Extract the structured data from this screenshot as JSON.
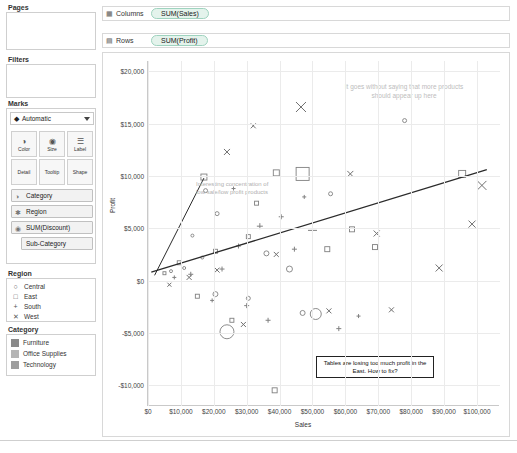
{
  "shelves": {
    "pages_title": "Pages",
    "filters_title": "Filters",
    "marks_title": "Marks",
    "columns_label": "Columns",
    "rows_label": "Rows",
    "columns_pill": "SUM(Sales)",
    "rows_pill": "SUM(Profit)",
    "columns_icon": "columns-grid-icon",
    "rows_icon": "rows-grid-icon"
  },
  "marks": {
    "type_value": "Automatic",
    "type_icon": "mark-type-icon",
    "buttons": [
      {
        "label": "Color",
        "icon": "color-palette-icon"
      },
      {
        "label": "Size",
        "icon": "size-circle-icon"
      },
      {
        "label": "Label",
        "icon": "label-text-icon"
      },
      {
        "label": "Detail",
        "icon": "detail-icon"
      },
      {
        "label": "Tooltip",
        "icon": "tooltip-icon"
      },
      {
        "label": "Shape",
        "icon": "shape-icon"
      }
    ],
    "pills": [
      {
        "label": "Category",
        "icon": "color-palette-icon",
        "indent": false
      },
      {
        "label": "Region",
        "icon": "shape-icon",
        "indent": false
      },
      {
        "label": "SUM(Discount)",
        "icon": "size-circle-icon",
        "indent": false
      },
      {
        "label": "Sub-Category",
        "icon": "",
        "indent": true
      }
    ]
  },
  "legends": {
    "region": {
      "title": "Region",
      "items": [
        {
          "label": "Central",
          "glyph": "○"
        },
        {
          "label": "East",
          "glyph": "□"
        },
        {
          "label": "South",
          "glyph": "+"
        },
        {
          "label": "West",
          "glyph": "✕"
        }
      ]
    },
    "category": {
      "title": "Category",
      "items": [
        {
          "label": "Furniture",
          "color": "#8a8a8a"
        },
        {
          "label": "Office Supplies",
          "color": "#b5b5b5"
        },
        {
          "label": "Technology",
          "color": "#9e9e9e"
        }
      ]
    }
  },
  "annotations": {
    "top": "It goes without saying that more products should appear up here",
    "left": "Interesting concentration of low sale/low profit products",
    "callout": "Tables are losing too much profit in the East. How to fix?"
  },
  "chart_data": {
    "type": "scatter",
    "title": "",
    "xlabel": "Sales",
    "ylabel": "Profit",
    "xlim": [
      0,
      107000
    ],
    "ylim": [
      -12000,
      21000
    ],
    "xticks": [
      "$0",
      "$10,000",
      "$20,000",
      "$30,000",
      "$40,000",
      "$50,000",
      "$60,000",
      "$70,000",
      "$80,000",
      "$90,000",
      "$100,000"
    ],
    "xtick_values": [
      0,
      10000,
      20000,
      30000,
      40000,
      50000,
      60000,
      70000,
      80000,
      90000,
      100000
    ],
    "yticks": [
      "$20,000",
      "$15,000",
      "$10,000",
      "$5,000",
      "$0",
      "-$5,000",
      "-$10,000"
    ],
    "ytick_values": [
      20000,
      15000,
      10000,
      5000,
      0,
      -5000,
      -10000
    ],
    "grid": true,
    "legend_position": "left-panel",
    "trendline": {
      "x0": 1000,
      "y0": 800,
      "x1": 103000,
      "y1": 10600
    },
    "inner_trendline": {
      "x0": 2000,
      "y0": 500,
      "x1": 17000,
      "y1": 9800
    },
    "series": [
      {
        "name": "Central",
        "shape": "circle",
        "points": [
          {
            "x": 24000,
            "y": -4900,
            "size": 14
          },
          {
            "x": 51000,
            "y": -3200,
            "size": 11
          },
          {
            "x": 43000,
            "y": 1100,
            "size": 6
          },
          {
            "x": 20500,
            "y": -1300,
            "size": 5
          },
          {
            "x": 36000,
            "y": 2600,
            "size": 5
          },
          {
            "x": 47000,
            "y": -3100,
            "size": 5
          },
          {
            "x": 30500,
            "y": -1700,
            "size": 4
          },
          {
            "x": 78000,
            "y": 15300,
            "size": 4
          },
          {
            "x": 55500,
            "y": 8300,
            "size": 4
          },
          {
            "x": 17500,
            "y": 8600,
            "size": 4
          },
          {
            "x": 21000,
            "y": 6400,
            "size": 4
          },
          {
            "x": 13500,
            "y": 4300,
            "size": 3
          },
          {
            "x": 11000,
            "y": 1200,
            "size": 3
          },
          {
            "x": 7000,
            "y": 900,
            "size": 3
          },
          {
            "x": 16500,
            "y": 2200,
            "size": 3
          }
        ]
      },
      {
        "name": "East",
        "shape": "square",
        "points": [
          {
            "x": 47000,
            "y": 10200,
            "size": 13
          },
          {
            "x": 95500,
            "y": 10200,
            "size": 7
          },
          {
            "x": 39000,
            "y": 10300,
            "size": 6
          },
          {
            "x": 17000,
            "y": 9900,
            "size": 6
          },
          {
            "x": 62000,
            "y": 4900,
            "size": 5
          },
          {
            "x": 69000,
            "y": 3200,
            "size": 5
          },
          {
            "x": 54500,
            "y": 3000,
            "size": 5
          },
          {
            "x": 30500,
            "y": 4200,
            "size": 4
          },
          {
            "x": 20500,
            "y": 2800,
            "size": 4
          },
          {
            "x": 9500,
            "y": 1700,
            "size": 4
          },
          {
            "x": 38500,
            "y": -10500,
            "size": 5
          },
          {
            "x": 25500,
            "y": -3800,
            "size": 4
          },
          {
            "x": 15000,
            "y": -1500,
            "size": 4
          },
          {
            "x": 5000,
            "y": 700,
            "size": 3
          },
          {
            "x": 33000,
            "y": 7400,
            "size": 4
          }
        ]
      },
      {
        "name": "South",
        "shape": "plus",
        "points": [
          {
            "x": 50000,
            "y": 4800,
            "size": 9
          },
          {
            "x": 34000,
            "y": 5200,
            "size": 6
          },
          {
            "x": 40500,
            "y": 6100,
            "size": 5
          },
          {
            "x": 44500,
            "y": 3000,
            "size": 5
          },
          {
            "x": 27500,
            "y": 3300,
            "size": 5
          },
          {
            "x": 22500,
            "y": 1100,
            "size": 5
          },
          {
            "x": 13000,
            "y": 600,
            "size": 5
          },
          {
            "x": 8000,
            "y": 300,
            "size": 4
          },
          {
            "x": 30000,
            "y": -2400,
            "size": 5
          },
          {
            "x": 36500,
            "y": -3800,
            "size": 5
          },
          {
            "x": 58000,
            "y": -4600,
            "size": 5
          },
          {
            "x": 64000,
            "y": -3400,
            "size": 4
          },
          {
            "x": 19500,
            "y": -1900,
            "size": 4
          },
          {
            "x": 47500,
            "y": 8000,
            "size": 4
          },
          {
            "x": 26000,
            "y": 8800,
            "size": 4
          }
        ]
      },
      {
        "name": "West",
        "shape": "cross",
        "points": [
          {
            "x": 101500,
            "y": 9100,
            "size": 9
          },
          {
            "x": 98500,
            "y": 5400,
            "size": 7
          },
          {
            "x": 88500,
            "y": 1200,
            "size": 7
          },
          {
            "x": 69500,
            "y": 4500,
            "size": 6
          },
          {
            "x": 61500,
            "y": 10200,
            "size": 6
          },
          {
            "x": 46500,
            "y": 16600,
            "size": 10
          },
          {
            "x": 24000,
            "y": 12300,
            "size": 6
          },
          {
            "x": 32000,
            "y": 14800,
            "size": 5
          },
          {
            "x": 39000,
            "y": 2500,
            "size": 5
          },
          {
            "x": 21000,
            "y": 1000,
            "size": 5
          },
          {
            "x": 12500,
            "y": 300,
            "size": 5
          },
          {
            "x": 55000,
            "y": -2900,
            "size": 5
          },
          {
            "x": 74000,
            "y": -2800,
            "size": 5
          },
          {
            "x": 29000,
            "y": -4200,
            "size": 5
          },
          {
            "x": 6500,
            "y": -400,
            "size": 4
          }
        ]
      }
    ]
  }
}
